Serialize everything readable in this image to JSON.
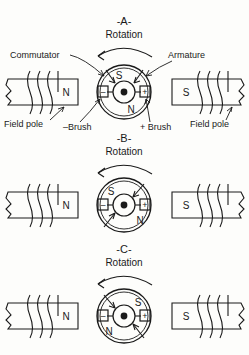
{
  "figure": {
    "background_color": "#fdfdfb",
    "ink_color": "#1a1a1a"
  },
  "panels": [
    {
      "id": "A",
      "caption": "-A-",
      "rotation_label": "Rotation",
      "rotation_direction": "counter-clockwise",
      "left_pole": {
        "label": "N",
        "name": "field-pole-left",
        "windings": 3
      },
      "right_pole": {
        "label": "S",
        "name": "field-pole-right",
        "windings": 3
      },
      "rotor": {
        "top_label": "S",
        "bottom_label": "N",
        "top_label_position": "top",
        "bottom_label_position": "bottom",
        "brush_minus": "–",
        "brush_plus": "+"
      },
      "callouts": {
        "commutator": "Commutator",
        "armature": "Armature",
        "field_pole_left": "Field pole",
        "field_pole_right": "Field pole",
        "brush_minus": "–Brush",
        "brush_plus": "+ Brush"
      }
    },
    {
      "id": "B",
      "caption": "-B-",
      "rotation_label": "Rotation",
      "rotation_direction": "counter-clockwise",
      "left_pole": {
        "label": "N",
        "name": "field-pole-left",
        "windings": 3
      },
      "right_pole": {
        "label": "S",
        "name": "field-pole-right",
        "windings": 3
      },
      "rotor": {
        "top_label": "S",
        "bottom_label": "N",
        "top_label_position": "upper-left",
        "bottom_label_position": "lower-right",
        "brush_minus": "–",
        "brush_plus": "+"
      },
      "callouts": {}
    },
    {
      "id": "C",
      "caption": "-C-",
      "rotation_label": "Rotation",
      "rotation_direction": "counter-clockwise",
      "left_pole": {
        "label": "N",
        "name": "field-pole-left",
        "windings": 3
      },
      "right_pole": {
        "label": "S",
        "name": "field-pole-right",
        "windings": 3
      },
      "rotor": {
        "top_label": "S",
        "bottom_label": "N",
        "top_label_position": "upper-right",
        "bottom_label_position": "lower-left",
        "brush_minus": "–",
        "brush_plus": "+"
      },
      "callouts": {}
    }
  ]
}
